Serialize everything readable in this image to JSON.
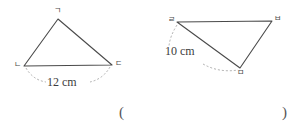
{
  "page": {
    "type": "geometry-figure",
    "background_color": "#ffffff",
    "stroke_color": "#4a4a4a",
    "text_color": "#3c3c3c",
    "width": 303,
    "height": 135
  },
  "figures": {
    "left_triangle": {
      "name": "triangle-gnd",
      "vertices": [
        {
          "label": "ㄱ",
          "position": "top",
          "x": 58,
          "y": 19
        },
        {
          "label": "ㄴ",
          "position": "bottom-left",
          "x": 24,
          "y": 66
        },
        {
          "label": "ㄷ",
          "position": "bottom-right",
          "x": 112,
          "y": 65
        }
      ],
      "measure": {
        "text": "12 cm",
        "value": 12,
        "unit": "cm",
        "side": "ㄴㄷ"
      }
    },
    "right_triangle": {
      "name": "triangle-rmb",
      "vertices": [
        {
          "label": "ㄹ",
          "position": "top-left",
          "x": 177,
          "y": 22
        },
        {
          "label": "ㅂ",
          "position": "top-right",
          "x": 272,
          "y": 21
        },
        {
          "label": "ㅁ",
          "position": "bottom",
          "x": 240,
          "y": 68
        }
      ],
      "measure": {
        "text": "10 cm",
        "value": 10,
        "unit": "cm",
        "side": "ㄹㅁ"
      }
    }
  },
  "answer_blank": {
    "open_paren": "(",
    "close_paren": ")",
    "value": ""
  }
}
